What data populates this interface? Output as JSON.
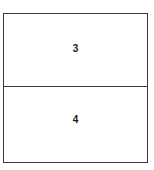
{
  "diagram": {
    "type": "two-cell-table",
    "border_color": "#3a3a3a",
    "background_color": "#ffffff",
    "text_color": "#1a1a1a",
    "rows": [
      {
        "label": "3"
      },
      {
        "label": "4"
      }
    ]
  }
}
